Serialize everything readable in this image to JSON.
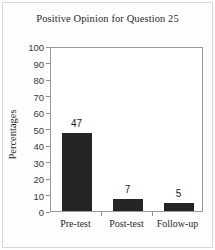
{
  "chart_data": {
    "type": "bar",
    "title": "Positive Opinion for Question 25",
    "xlabel": "",
    "ylabel": "Percentages",
    "categories": [
      "Pre-test",
      "Post-test",
      "Follow-up"
    ],
    "values": [
      47,
      7,
      5
    ],
    "value_labels": [
      "47",
      "7",
      "5"
    ],
    "ylim": [
      0,
      100
    ],
    "ytick_labels": [
      "100",
      "90",
      "80",
      "70",
      "60",
      "50",
      "40",
      "30",
      "20",
      "10",
      "0"
    ],
    "ytick_values": [
      100,
      90,
      80,
      70,
      60,
      50,
      40,
      30,
      20,
      10,
      0
    ],
    "grid": false,
    "legend": false,
    "bar_color": "#252525",
    "axis_color": "#9a9a9a",
    "text_color": "#2b2b2b"
  }
}
